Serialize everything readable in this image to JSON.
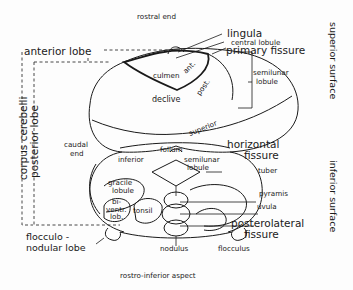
{
  "diagram": {
    "title_top": "rostral end",
    "title_bottom": "rostro-inferior aspect",
    "side_labels": {
      "superior_surface": "superior surface",
      "inferior_surface": "inferior surface",
      "corpus_cerebelli": "corpus cerebelli",
      "posterior_lobe": "posterior lobe",
      "caudal_end_1": "caudal",
      "caudal_end_2": "end"
    },
    "lobes": {
      "anterior_lobe": "anterior lobe",
      "flocculonodular_1": "flocculo -",
      "flocculonodular_2": "nodular  lobe"
    },
    "structures": {
      "lingula": "lingula",
      "central_lobule": "central lobule",
      "primary_fissure": "primary fissure",
      "culmen": "culmen",
      "ant": "ant.",
      "post": "post.",
      "declive": "declive",
      "semilunar_lobule_sup_1": "semilunar",
      "semilunar_lobule_sup_2": "lobule",
      "superior": "superior",
      "folium": "folium",
      "inferior": "inferior",
      "semilunar_lobule_inf_1": "semilunar",
      "semilunar_lobule_inf_2": "lobule",
      "horizontal_fissure_1": "horizontal",
      "horizontal_fissure_2": "fissure",
      "gracile_lobule_1": "gracile",
      "gracile_lobule_2": "lobule",
      "biventral_1": "bi-",
      "biventral_2": "ventr.",
      "biventral_3": "lob.",
      "tonsil": "tonsil",
      "tuber": "tuber",
      "pyramis": "pyramis",
      "uvula": "uvula",
      "posterolateral_fissure_1": "posterolateral",
      "posterolateral_fissure_2": "fissure",
      "nodulus": "nodulus",
      "flocculus": "flocculus"
    }
  }
}
